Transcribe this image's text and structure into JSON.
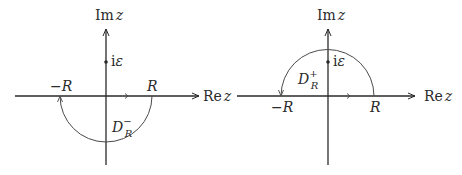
{
  "colors": {
    "axis": "#2a2a2a",
    "contour": "#4a4a4a",
    "background": "#ffffff"
  },
  "diagrams": [
    {
      "id": "lower",
      "axis_labels": {
        "imag_prefix": "Im",
        "imag_var": "z",
        "real_prefix": "Re",
        "real_var": "z"
      },
      "points": {
        "neg_R": "−R",
        "pos_R": "R",
        "i_eps_prefix": "i",
        "i_eps_var": "ε"
      },
      "region": {
        "base": "D",
        "sup": "−",
        "sub": "R"
      },
      "contour": "lower-semicircle"
    },
    {
      "id": "upper",
      "axis_labels": {
        "imag_prefix": "Im",
        "imag_var": "z",
        "real_prefix": "Re",
        "real_var": "z"
      },
      "points": {
        "neg_R": "−R",
        "pos_R": "R",
        "i_eps_prefix": "i",
        "i_eps_var": "ε"
      },
      "region": {
        "base": "D",
        "sup": "+",
        "sub": "R"
      },
      "contour": "upper-semicircle"
    }
  ]
}
